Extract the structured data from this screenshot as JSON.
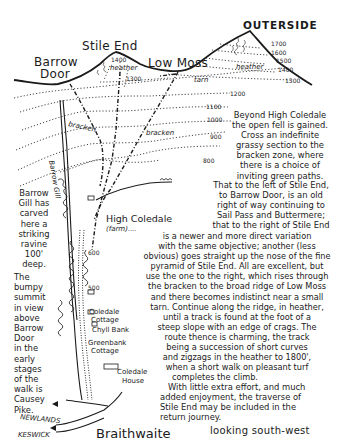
{
  "summits": {
    "stile_end": "Stile End",
    "outerside": "OUTERSIDE",
    "barrow_door": [
      "Barrow",
      "Door"
    ],
    "low_moss": "Low Moss"
  },
  "terrain_labels": {
    "heather_left": "heather",
    "heather_right": "heather",
    "tarn": "tarn",
    "bracken_1": "bracken",
    "bracken_2": "bracken",
    "barrow_gill": "Barrow Gill"
  },
  "contours": {
    "stile_end": [
      "1400",
      "1300"
    ],
    "outerside": [
      "1700",
      "1600",
      "1500",
      "1400",
      "1300"
    ],
    "main": [
      "1200",
      "1100",
      "1000",
      "900",
      "800"
    ],
    "valley": [
      "600",
      "500"
    ]
  },
  "places": {
    "high_coledale": "High Coledale",
    "farm": "(farm)....",
    "coledale_cottage": [
      "Coledale",
      "Cottage"
    ],
    "chyll_bank": "Chyll Bank",
    "greenbank_cottage": [
      "Greenbank",
      "Cottage"
    ],
    "coledale_house": [
      "Coledale",
      "House"
    ],
    "braithwaite": "Braithwaite",
    "newlands": "NEWLANDS",
    "keswick": "KESWICK"
  },
  "side_notes": {
    "barrow_gill": [
      "Barrow",
      "Gill has",
      "carved",
      "here a",
      "striking",
      "ravine",
      "100'",
      "deep."
    ],
    "bumpy_summit": [
      "The",
      "bumpy",
      "summit",
      "in view",
      "above",
      "Barrow",
      "Door",
      "in the",
      "early",
      "stages",
      "of the",
      "walk is",
      "Causey",
      "Pike."
    ]
  },
  "description": [
    "Beyond High Coledale",
    "the open fell is gained.",
    "Cross an indefinite",
    "grassy section to the",
    "bracken zone, where",
    "there is a choice of",
    "inviting green paths.",
    "That to the left of Stile End,",
    "to Barrow Door, is an old",
    "right of way continuing to",
    "Sail Pass and Buttermere;",
    "that to the right of Stile End",
    "is a newer and more direct variation",
    "with the same objective; another (less",
    "obvious) goes straight up the nose of the fine",
    "pyramid of Stile End. All are excellent, but",
    "use the one to the right, which rises through",
    "the bracken to the broad ridge of Low Moss",
    "and there becomes indistinct near a small",
    "tarn. Continue along the ridge, in heather,",
    "until a track is found at the foot of a",
    "steep slope with an edge of crags. The",
    "route thence is charming, the track",
    "being a succession of short curves",
    "and zigzags in the heather to 1800',",
    "when a short walk on pleasant turf",
    "completes the climb.",
    "With little extra effort, and much",
    "added enjoyment, the traverse of",
    "Stile End may be included in the",
    "return journey."
  ],
  "caption": "looking south-west"
}
